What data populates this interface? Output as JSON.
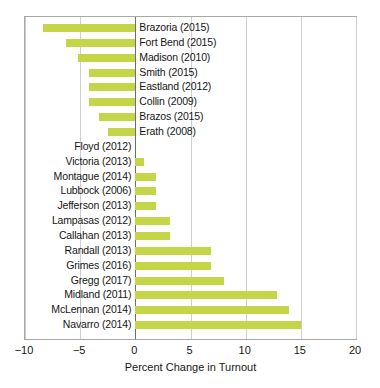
{
  "chart_data": {
    "type": "bar",
    "orientation": "horizontal",
    "title": "",
    "xlabel": "Percent Change in Turnout",
    "ylabel": "",
    "xlim": [
      -10,
      20
    ],
    "xticks": [
      -10,
      -5,
      0,
      5,
      10,
      15,
      20
    ],
    "xtick_labels": [
      "−10",
      "−5",
      "0",
      "5",
      "10",
      "15",
      "20"
    ],
    "grid": "vertical",
    "legend": "none",
    "bar_color": "#c4d648",
    "zero_line_color": "#6e6e6e",
    "categories": [
      "Brazoria (2015)",
      "Fort Bend (2015)",
      "Madison (2010)",
      "Smith (2015)",
      "Eastland (2012)",
      "Collin (2009)",
      "Brazos (2015)",
      "Erath (2008)",
      "Floyd (2012)",
      "Victoria (2013)",
      "Montague (2014)",
      "Lubbock (2006)",
      "Jefferson (2013)",
      "Lampasas (2012)",
      "Callahan (2013)",
      "Randall (2013)",
      "Grimes (2016)",
      "Gregg (2017)",
      "Midland (2011)",
      "McLennan (2014)",
      "Navarro (2014)"
    ],
    "values": [
      -8.4,
      -6.3,
      -5.2,
      -4.2,
      -4.2,
      -4.2,
      -3.3,
      -2.5,
      0.0,
      0.8,
      1.9,
      1.9,
      1.9,
      3.1,
      3.1,
      6.9,
      6.9,
      8.0,
      12.8,
      13.9,
      15.0
    ]
  }
}
